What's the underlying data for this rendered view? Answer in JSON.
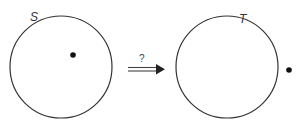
{
  "diagram": {
    "type": "transformation",
    "left": {
      "label": "S",
      "description": "circle with point inside",
      "circle": {
        "cx": 61,
        "cy": 67,
        "r": 51
      },
      "point": {
        "cx": 73,
        "cy": 55,
        "position": "inside"
      }
    },
    "arrow": {
      "label": "?",
      "style": "double-line implication arrow"
    },
    "right": {
      "label": "T",
      "description": "circle with point outside",
      "circle": {
        "cx": 227,
        "cy": 67,
        "r": 51
      },
      "point": {
        "cx": 289,
        "cy": 70,
        "position": "outside"
      }
    },
    "colors": {
      "stroke": "#333333",
      "point": "#111111",
      "background": "#ffffff"
    }
  }
}
